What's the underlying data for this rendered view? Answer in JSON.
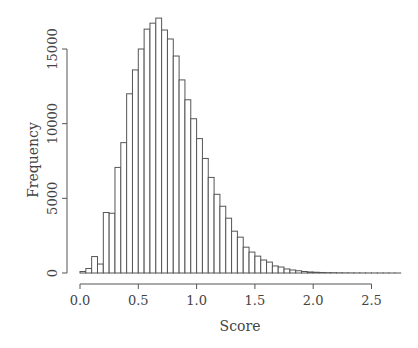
{
  "chart_data": {
    "type": "bar",
    "subtype": "histogram",
    "title": "",
    "xlabel": "Score",
    "ylabel": "Frequency",
    "xlim": [
      0.0,
      2.75
    ],
    "ylim": [
      0,
      17500
    ],
    "bin_width": 0.05,
    "x_ticks": [
      "0.0",
      "0.5",
      "1.0",
      "1.5",
      "2.0",
      "2.5"
    ],
    "y_ticks": [
      "0",
      "5000",
      "10000",
      "15000"
    ],
    "grid": false,
    "legend": null,
    "bin_starts": [
      0.0,
      0.05,
      0.1,
      0.15,
      0.2,
      0.25,
      0.3,
      0.35,
      0.4,
      0.45,
      0.5,
      0.55,
      0.6,
      0.65,
      0.7,
      0.75,
      0.8,
      0.85,
      0.9,
      0.95,
      1.0,
      1.05,
      1.1,
      1.15,
      1.2,
      1.25,
      1.3,
      1.35,
      1.4,
      1.45,
      1.5,
      1.55,
      1.6,
      1.65,
      1.7,
      1.75,
      1.8,
      1.85,
      1.9,
      1.95,
      2.0,
      2.05,
      2.1,
      2.15,
      2.2,
      2.25,
      2.3,
      2.35,
      2.4,
      2.45,
      2.5,
      2.55,
      2.6,
      2.65,
      2.7
    ],
    "values": [
      100,
      300,
      1100,
      600,
      4050,
      4000,
      7070,
      8730,
      12000,
      13600,
      15000,
      16330,
      16730,
      17070,
      16270,
      15670,
      14530,
      12930,
      11600,
      10330,
      9000,
      7670,
      6400,
      5270,
      4470,
      3670,
      2800,
      2400,
      1730,
      1400,
      1130,
      870,
      730,
      470,
      400,
      270,
      200,
      150,
      100,
      70,
      50,
      35,
      25,
      20,
      15,
      10,
      8,
      6,
      5,
      4,
      3,
      2,
      2,
      1,
      1
    ]
  }
}
